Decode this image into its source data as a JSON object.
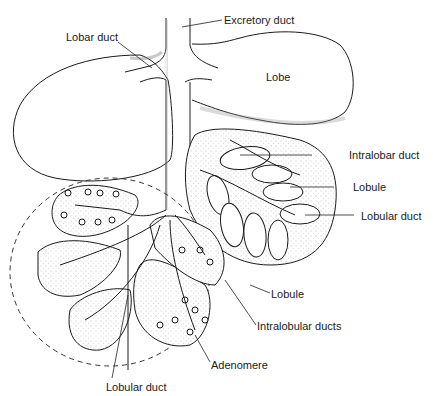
{
  "diagram": {
    "type": "anatomical-illustration",
    "labels": {
      "excretory_duct": "Excretory duct",
      "lobar_duct": "Lobar duct",
      "lobe": "Lobe",
      "intralobar_duct": "Intralobar duct",
      "lobule_upper": "Lobule",
      "lobular_duct_right": "Lobular duct",
      "lobule_lower": "Lobule",
      "intralobular_ducts": "Intralobular ducts",
      "adenomere": "Adenomere",
      "lobular_duct_bottom": "Lobular duct"
    },
    "colors": {
      "ink": "#1a1a1a",
      "background": "#ffffff",
      "stipple": "#888888"
    }
  }
}
